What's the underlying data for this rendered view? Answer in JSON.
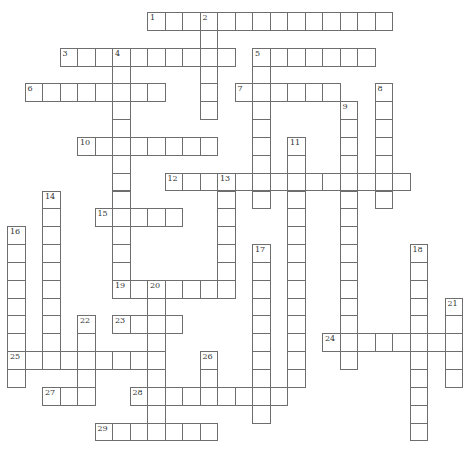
{
  "puzzle": {
    "type": "crossword",
    "grid_origin": {
      "left": 7,
      "top": 12
    },
    "cell_size": {
      "w": 17.5,
      "h": 17.85
    },
    "colors": {
      "border": "#6e6e6e",
      "background": "#ffffff",
      "number": "#333333"
    },
    "words": [
      {
        "number": "1",
        "dir": "across",
        "row": 0,
        "col": 8,
        "length": 14
      },
      {
        "number": "2",
        "dir": "down",
        "row": 0,
        "col": 11,
        "length": 6
      },
      {
        "number": "3",
        "dir": "across",
        "row": 2,
        "col": 3,
        "length": 10
      },
      {
        "number": "4",
        "dir": "down",
        "row": 2,
        "col": 6,
        "length": 14
      },
      {
        "number": "5",
        "dir": "across",
        "row": 2,
        "col": 14,
        "length": 7
      },
      {
        "number": "5",
        "dir": "down",
        "row": 2,
        "col": 14,
        "length": 9
      },
      {
        "number": "6",
        "dir": "across",
        "row": 4,
        "col": 1,
        "length": 8
      },
      {
        "number": "7",
        "dir": "across",
        "row": 4,
        "col": 13,
        "length": 6
      },
      {
        "number": "8",
        "dir": "down",
        "row": 4,
        "col": 21,
        "length": 7
      },
      {
        "number": "9",
        "dir": "down",
        "row": 5,
        "col": 19,
        "length": 15
      },
      {
        "number": "10",
        "dir": "across",
        "row": 7,
        "col": 4,
        "length": 8
      },
      {
        "number": "11",
        "dir": "down",
        "row": 7,
        "col": 16,
        "length": 14
      },
      {
        "number": "12",
        "dir": "across",
        "row": 9,
        "col": 9,
        "length": 14
      },
      {
        "number": "13",
        "dir": "down",
        "row": 9,
        "col": 12,
        "length": 7
      },
      {
        "number": "14",
        "dir": "down",
        "row": 10,
        "col": 2,
        "length": 10
      },
      {
        "number": "15",
        "dir": "across",
        "row": 11,
        "col": 5,
        "length": 5
      },
      {
        "number": "16",
        "dir": "down",
        "row": 12,
        "col": 0,
        "length": 9
      },
      {
        "number": "17",
        "dir": "down",
        "row": 13,
        "col": 14,
        "length": 10
      },
      {
        "number": "18",
        "dir": "down",
        "row": 13,
        "col": 23,
        "length": 11
      },
      {
        "number": "19",
        "dir": "across",
        "row": 15,
        "col": 6,
        "length": 7
      },
      {
        "number": "20",
        "dir": "down",
        "row": 15,
        "col": 8,
        "length": 9
      },
      {
        "number": "21",
        "dir": "down",
        "row": 16,
        "col": 25,
        "length": 5
      },
      {
        "number": "22",
        "dir": "down",
        "row": 17,
        "col": 4,
        "length": 5
      },
      {
        "number": "23",
        "dir": "across",
        "row": 17,
        "col": 6,
        "length": 4
      },
      {
        "number": "24",
        "dir": "across",
        "row": 18,
        "col": 18,
        "length": 8
      },
      {
        "number": "25",
        "dir": "across",
        "row": 19,
        "col": 0,
        "length": 9
      },
      {
        "number": "26",
        "dir": "down",
        "row": 19,
        "col": 11,
        "length": 3
      },
      {
        "number": "27",
        "dir": "across",
        "row": 21,
        "col": 2,
        "length": 3
      },
      {
        "number": "28",
        "dir": "across",
        "row": 21,
        "col": 7,
        "length": 9
      },
      {
        "number": "29",
        "dir": "across",
        "row": 23,
        "col": 5,
        "length": 7
      }
    ]
  }
}
